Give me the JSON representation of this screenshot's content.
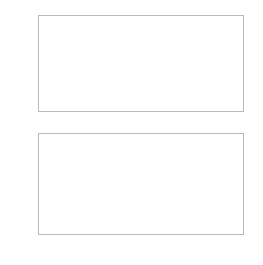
{
  "chart_data": [
    {
      "panel": "top",
      "type": "line",
      "title": "",
      "xlabel": "",
      "ylabel": "",
      "xlim": [
        0.33,
        0.37
      ],
      "ylim": [
        -1.0,
        1.0
      ],
      "grid": true,
      "legend": "none",
      "xticks": [
        "0.33",
        "0.34",
        "0.35",
        "0.36",
        "0.37"
      ],
      "xtick_values": [
        0.33,
        0.34,
        0.35,
        0.36,
        0.37
      ],
      "yticks": [
        "1.0",
        "0.5",
        "0.0",
        "-0.5",
        "-1.0"
      ],
      "ytick_values": [
        1.0,
        0.5,
        0.0,
        -0.5,
        -1.0
      ],
      "series": [
        {
          "name": "sine-amplitude-1",
          "amplitude": 1.0,
          "period": 0.02,
          "phase_zero_x": 0.33,
          "direction": "negative-first",
          "color": "#b0b0b0",
          "x": [
            0.33,
            0.3325,
            0.335,
            0.3375,
            0.34,
            0.3425,
            0.345,
            0.3475,
            0.35,
            0.3525,
            0.355,
            0.3575,
            0.36,
            0.3625,
            0.365,
            0.3675,
            0.37
          ],
          "values": [
            0.0,
            -0.71,
            -1.0,
            -0.71,
            0.0,
            0.71,
            1.0,
            0.71,
            0.0,
            -0.71,
            -1.0,
            -0.71,
            0.0,
            0.71,
            1.0,
            0.71,
            0.0
          ]
        },
        {
          "name": "sine-amplitude-0p5",
          "amplitude": 0.5,
          "period": 0.02,
          "phase_zero_x": 0.33,
          "direction": "negative-first",
          "color": "#a8a8a8",
          "x": [
            0.33,
            0.3325,
            0.335,
            0.3375,
            0.34,
            0.3425,
            0.345,
            0.3475,
            0.35,
            0.3525,
            0.355,
            0.3575,
            0.36,
            0.3625,
            0.365,
            0.3675,
            0.37
          ],
          "values": [
            0.0,
            -0.354,
            -0.5,
            -0.354,
            0.0,
            0.354,
            0.5,
            0.354,
            0.0,
            -0.354,
            -0.5,
            -0.354,
            0.0,
            0.354,
            0.5,
            0.354,
            0.0
          ]
        }
      ]
    },
    {
      "panel": "bottom",
      "type": "line",
      "title": "",
      "xlabel": "",
      "ylabel": "",
      "xlim": [
        0.33,
        0.37
      ],
      "ylim": [
        0.0,
        1.0
      ],
      "grid": true,
      "legend": "none",
      "xticks": [
        "0.33",
        "0.34",
        "0.35",
        "0.36",
        "0.37"
      ],
      "xtick_values": [
        0.33,
        0.34,
        0.35,
        0.36,
        0.37
      ],
      "yticks": [
        "1.0",
        "0.8",
        "0.6",
        "0.4",
        "0.2",
        "0.0"
      ],
      "ytick_values": [
        1.0,
        0.8,
        0.6,
        0.4,
        0.2,
        0.0
      ],
      "series": [
        {
          "name": "rectified-sine-amplitude-1",
          "amplitude": 1.0,
          "period": 0.01,
          "color": "#b0b0b0",
          "x": [
            0.33,
            0.3325,
            0.335,
            0.3375,
            0.34,
            0.3425,
            0.345,
            0.3475,
            0.35,
            0.3525,
            0.355,
            0.3575,
            0.36,
            0.3625,
            0.365,
            0.3675,
            0.37
          ],
          "values": [
            0.0,
            0.71,
            1.0,
            0.71,
            0.0,
            0.71,
            1.0,
            0.71,
            0.0,
            0.71,
            1.0,
            0.71,
            0.0,
            0.71,
            1.0,
            0.71,
            0.0
          ]
        },
        {
          "name": "rectified-sine-amplitude-0p5",
          "amplitude": 0.5,
          "period": 0.01,
          "color": "#a8a8a8",
          "x": [
            0.33,
            0.3325,
            0.335,
            0.3375,
            0.34,
            0.3425,
            0.345,
            0.3475,
            0.35,
            0.3525,
            0.355,
            0.3575,
            0.36,
            0.3625,
            0.365,
            0.3675,
            0.37
          ],
          "values": [
            0.0,
            0.354,
            0.5,
            0.354,
            0.0,
            0.354,
            0.5,
            0.354,
            0.0,
            0.354,
            0.5,
            0.354,
            0.0,
            0.354,
            0.5,
            0.354,
            0.0
          ]
        }
      ]
    }
  ],
  "style": {
    "background": "#ffffff",
    "frame_color": "#b9b9b9",
    "grid_color": "#d8d8d8",
    "tick_color": "#9a9a9a",
    "label_color": "#6d6d6d",
    "curve_color_primary": "#b0b0b0",
    "curve_color_secondary": "#a8a8a8"
  }
}
